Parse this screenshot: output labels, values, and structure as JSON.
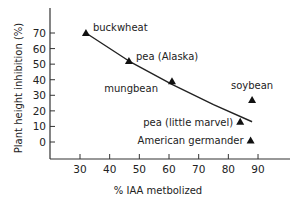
{
  "chart_data": {
    "type": "scatter",
    "title": "",
    "xlabel": "% IAA metbolized",
    "ylabel": "Plant height inhibition (%)",
    "xlim": [
      20,
      100
    ],
    "ylim": [
      -8,
      80
    ],
    "xticks": [
      30,
      40,
      50,
      60,
      70,
      80,
      90
    ],
    "yticks": [
      0,
      10,
      20,
      30,
      40,
      50,
      60,
      70
    ],
    "grid": false,
    "legend": null,
    "marker": "triangle",
    "points": [
      {
        "label": "buckwheat",
        "x": 32,
        "y": 70
      },
      {
        "label": "pea (Alaska)",
        "x": 46.5,
        "y": 52
      },
      {
        "label": "mungbean",
        "x": 61,
        "y": 39
      },
      {
        "label": "soybean",
        "x": 88,
        "y": 27
      },
      {
        "label": "pea (little marvel)",
        "x": 84,
        "y": 13
      },
      {
        "label": "American germander",
        "x": 87.5,
        "y": 1
      }
    ],
    "trend_line": {
      "type": "curve",
      "points": [
        [
          32,
          70
        ],
        [
          46.5,
          52
        ],
        [
          61,
          37
        ],
        [
          75,
          24
        ],
        [
          88,
          13
        ]
      ]
    }
  }
}
